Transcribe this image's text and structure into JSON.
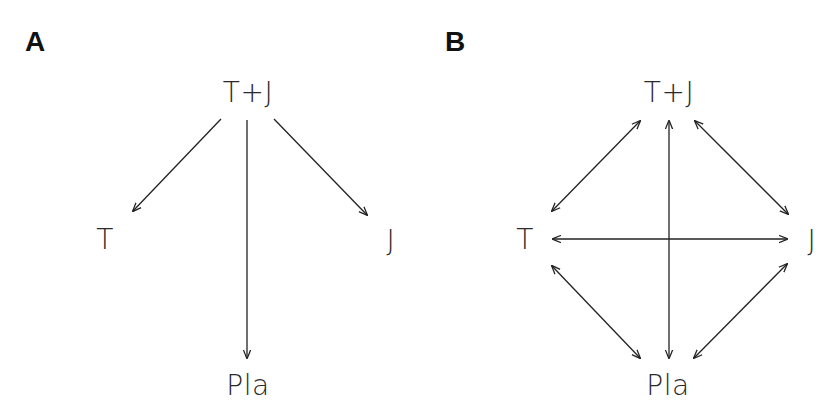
{
  "panels": [
    {
      "label": "A",
      "nodes": {
        "top": "T+J",
        "left": "T",
        "right": "J",
        "bottom": "Pla"
      },
      "edges": [
        {
          "from": "T+J",
          "to": "T",
          "direction": "one-way"
        },
        {
          "from": "T+J",
          "to": "Pla",
          "direction": "one-way"
        },
        {
          "from": "T+J",
          "to": "J",
          "direction": "one-way"
        }
      ]
    },
    {
      "label": "B",
      "nodes": {
        "top": "T+J",
        "left": "T",
        "right": "J",
        "bottom": "Pla"
      },
      "edges": [
        {
          "from": "T+J",
          "to": "T",
          "direction": "bidirectional"
        },
        {
          "from": "T+J",
          "to": "Pla",
          "direction": "bidirectional"
        },
        {
          "from": "T+J",
          "to": "J",
          "direction": "bidirectional"
        },
        {
          "from": "T",
          "to": "J",
          "direction": "bidirectional"
        },
        {
          "from": "T",
          "to": "Pla",
          "direction": "bidirectional"
        },
        {
          "from": "J",
          "to": "Pla",
          "direction": "bidirectional"
        }
      ]
    }
  ],
  "colors": {
    "line": "#222222",
    "text": "#2a2a2a",
    "background": "#ffffff"
  }
}
